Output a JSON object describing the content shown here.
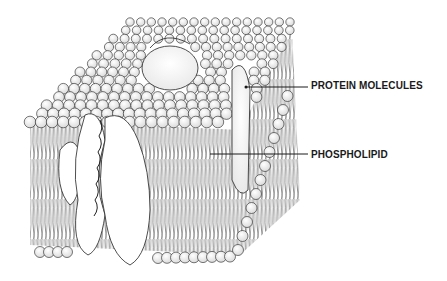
{
  "diagram": {
    "labels": [
      {
        "id": "protein",
        "text": "PROTEIN MOLECULES",
        "pointer_from": [
          246,
          87
        ],
        "pointer_to": [
          308,
          87
        ]
      },
      {
        "id": "phospholipid",
        "text": "PHOSPHOLIPID",
        "pointer_from": [
          210,
          154
        ],
        "pointer_to": [
          308,
          154
        ]
      }
    ],
    "colors": {
      "ink": "#1a1a1a",
      "head_fill": "#f4f4f4",
      "protein_fill": "#fafafa",
      "background": "#ffffff"
    }
  }
}
